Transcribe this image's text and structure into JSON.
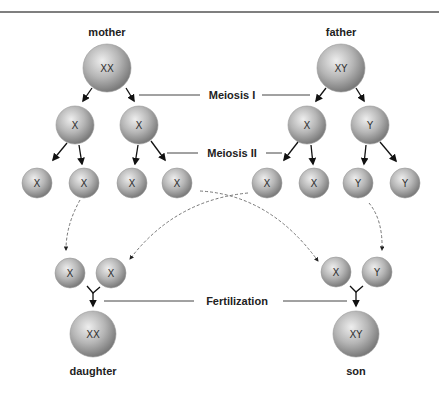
{
  "diagram": {
    "title_rule": true,
    "parents": {
      "mother": {
        "label": "mother",
        "chromosomes": "XX"
      },
      "father": {
        "label": "father",
        "chromosomes": "XY"
      }
    },
    "stages": {
      "meiosis1": "Meiosis I",
      "meiosis2": "Meiosis II",
      "fertilization": "Fertilization"
    },
    "meiosis1_cells": {
      "mother": [
        "X",
        "X"
      ],
      "father": [
        "X",
        "Y"
      ]
    },
    "gametes": {
      "mother": [
        "X",
        "X",
        "X",
        "X"
      ],
      "father": [
        "X",
        "X",
        "Y",
        "Y"
      ]
    },
    "zygote_pairs": {
      "daughter": [
        "X",
        "X"
      ],
      "son": [
        "X",
        "Y"
      ]
    },
    "offspring": {
      "daughter": {
        "label": "daughter",
        "chromosomes": "XX"
      },
      "son": {
        "label": "son",
        "chromosomes": "XY"
      }
    },
    "colors": {
      "cell_light": "#e6e6e6",
      "cell_dark": "#8a8a8a",
      "line": "#555555",
      "text": "#222222"
    }
  }
}
